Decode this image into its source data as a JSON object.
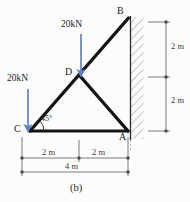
{
  "figure": {
    "caption": "(b)",
    "type": "truss-free-body-diagram"
  },
  "colors": {
    "member": "#141414",
    "load_arrow": "#5f82c8",
    "dimension": "#6d6d6d",
    "hatch": "#8c8c8c",
    "text": "#1b1b1b"
  },
  "nodes": [
    {
      "label": "B",
      "x": 128,
      "y": 18,
      "label_x": 117,
      "label_y": 8
    },
    {
      "label": "D",
      "x": 80,
      "y": 76,
      "label_x": 66,
      "label_y": 68
    },
    {
      "label": "C",
      "x": 30,
      "y": 131,
      "label_x": 16,
      "label_y": 124
    },
    {
      "label": "A",
      "x": 128,
      "y": 131,
      "label_x": 119,
      "label_y": 133
    }
  ],
  "members": [
    {
      "name": "member-C-B",
      "from": "C",
      "to": "B"
    },
    {
      "name": "member-C-A",
      "from": "C",
      "to": "A"
    },
    {
      "name": "member-D-A",
      "from": "D",
      "to": "A"
    }
  ],
  "loads": [
    {
      "name": "load-at-D",
      "magnitude": "20kN",
      "direction": "down",
      "label_x": 62,
      "label_y": 22,
      "arrow_x": 81,
      "arrow_top": 34,
      "arrow_bottom": 74
    },
    {
      "name": "load-at-C",
      "magnitude": "20kN",
      "direction": "down",
      "label_x": 8,
      "label_y": 76,
      "arrow_x": 28,
      "arrow_top": 89,
      "arrow_bottom": 129
    }
  ],
  "angle": {
    "value": "45°",
    "at_node": "C",
    "label_x": 40,
    "label_y": 118
  },
  "vertical_dimensions": [
    {
      "name": "dim-upper-2m",
      "value": "2 m",
      "label_x": 172,
      "label_y": 45
    },
    {
      "name": "dim-lower-2m",
      "value": "2 m",
      "label_x": 172,
      "label_y": 99
    }
  ],
  "horizontal_dimensions": [
    {
      "name": "dim-left-2m",
      "value": "2 m",
      "label_x": 48,
      "label_y": 150
    },
    {
      "name": "dim-right-2m",
      "value": "2 m",
      "label_x": 97,
      "label_y": 150
    },
    {
      "name": "dim-total-4m",
      "value": "4 m",
      "label_x": 72,
      "label_y": 163
    }
  ],
  "wall": {
    "name": "fixed-support-wall",
    "x": 130,
    "top": 17,
    "bottom": 139,
    "width": 14
  }
}
